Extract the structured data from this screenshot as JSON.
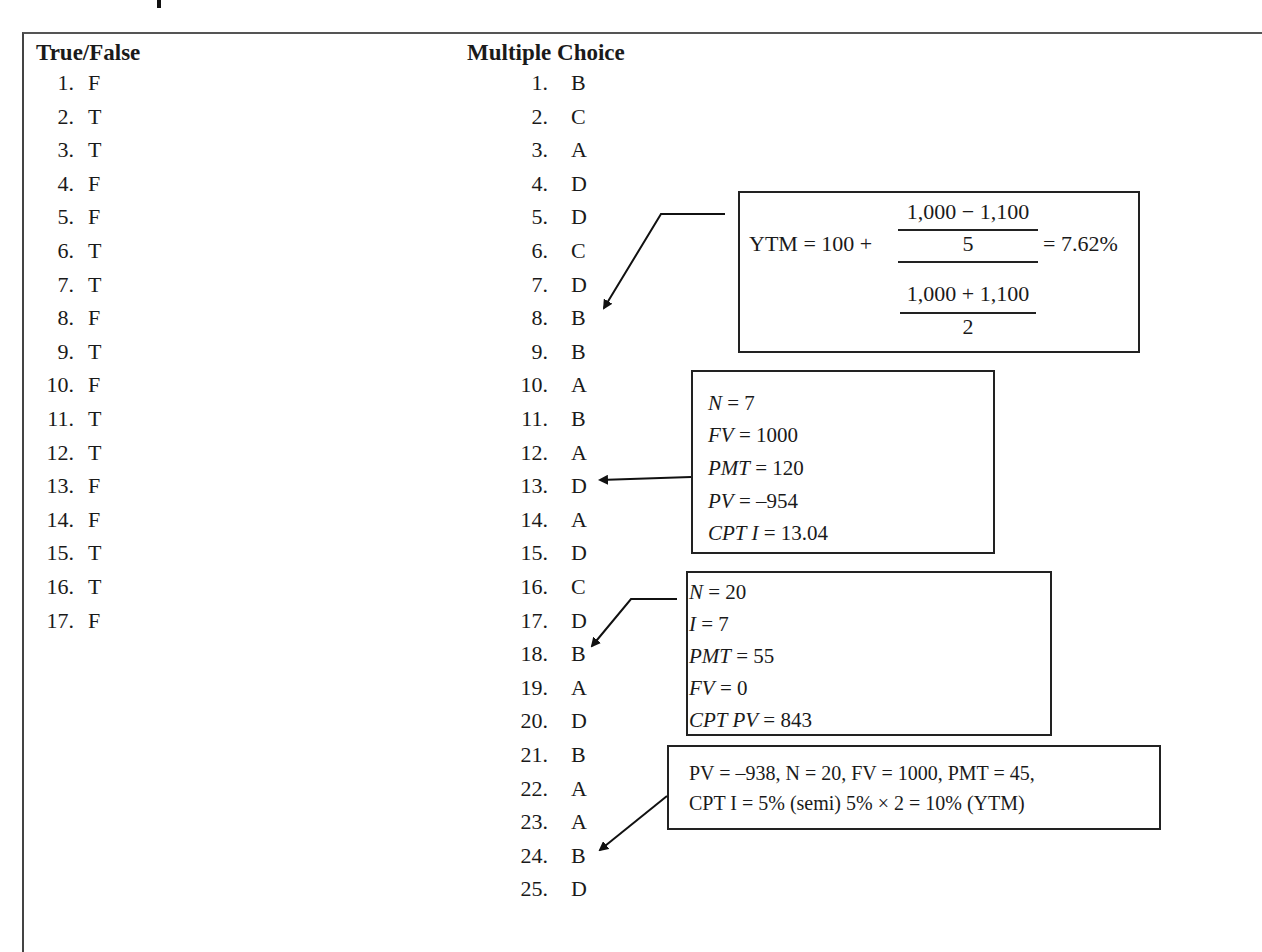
{
  "true_false": {
    "heading": "True/False",
    "items": [
      {
        "num": "1.",
        "answer": "F"
      },
      {
        "num": "2.",
        "answer": "T"
      },
      {
        "num": "3.",
        "answer": "T"
      },
      {
        "num": "4.",
        "answer": "F"
      },
      {
        "num": "5.",
        "answer": "F"
      },
      {
        "num": "6.",
        "answer": "T"
      },
      {
        "num": "7.",
        "answer": "T"
      },
      {
        "num": "8.",
        "answer": "F"
      },
      {
        "num": "9.",
        "answer": "T"
      },
      {
        "num": "10.",
        "answer": "F"
      },
      {
        "num": "11.",
        "answer": "T"
      },
      {
        "num": "12.",
        "answer": "T"
      },
      {
        "num": "13.",
        "answer": "F"
      },
      {
        "num": "14.",
        "answer": "F"
      },
      {
        "num": "15.",
        "answer": "T"
      },
      {
        "num": "16.",
        "answer": "T"
      },
      {
        "num": "17.",
        "answer": "F"
      }
    ]
  },
  "multiple_choice": {
    "heading": "Multiple Choice",
    "items": [
      {
        "num": "1.",
        "answer": "B"
      },
      {
        "num": "2.",
        "answer": "C"
      },
      {
        "num": "3.",
        "answer": "A"
      },
      {
        "num": "4.",
        "answer": "D"
      },
      {
        "num": "5.",
        "answer": "D"
      },
      {
        "num": "6.",
        "answer": "C"
      },
      {
        "num": "7.",
        "answer": "D"
      },
      {
        "num": "8.",
        "answer": "B"
      },
      {
        "num": "9.",
        "answer": "B"
      },
      {
        "num": "10.",
        "answer": "A"
      },
      {
        "num": "11.",
        "answer": "B"
      },
      {
        "num": "12.",
        "answer": "A"
      },
      {
        "num": "13.",
        "answer": "D"
      },
      {
        "num": "14.",
        "answer": "A"
      },
      {
        "num": "15.",
        "answer": "D"
      },
      {
        "num": "16.",
        "answer": "C"
      },
      {
        "num": "17.",
        "answer": "D"
      },
      {
        "num": "18.",
        "answer": "B"
      },
      {
        "num": "19.",
        "answer": "A"
      },
      {
        "num": "20.",
        "answer": "D"
      },
      {
        "num": "21.",
        "answer": "B"
      },
      {
        "num": "22.",
        "answer": "A"
      },
      {
        "num": "23.",
        "answer": "A"
      },
      {
        "num": "24.",
        "answer": "B"
      },
      {
        "num": "25.",
        "answer": "D"
      }
    ]
  },
  "annotations": {
    "ytm_formula": {
      "target_question": "8",
      "lhs": "YTM = 100 +",
      "numerator_top": "1,000 − 1,100",
      "numerator_bottom": "5",
      "denominator_top": "1,000 + 1,100",
      "denominator_bottom": "2",
      "result": "= 7.62%"
    },
    "calc_q13": {
      "target_question": "13",
      "lines": [
        {
          "var": "N",
          "value": "= 7"
        },
        {
          "var": "FV",
          "value": "= 1000"
        },
        {
          "var": "PMT",
          "value": "= 120"
        },
        {
          "var": "PV",
          "value": "= –954"
        },
        {
          "var": "CPT I",
          "value": "= 13.04"
        }
      ]
    },
    "calc_q18": {
      "target_question": "18",
      "lines": [
        {
          "var": "N",
          "value": "= 20"
        },
        {
          "var": "I",
          "value": "= 7"
        },
        {
          "var": "PMT",
          "value": "= 55"
        },
        {
          "var": "FV",
          "value": "= 0"
        },
        {
          "var": "CPT PV",
          "value": "= 843"
        }
      ]
    },
    "calc_q24": {
      "target_question": "24",
      "line1": "PV = –938, N = 20, FV = 1000, PMT = 45,",
      "line2": "CPT I = 5% (semi)  5% × 2 = 10% (YTM)"
    }
  }
}
